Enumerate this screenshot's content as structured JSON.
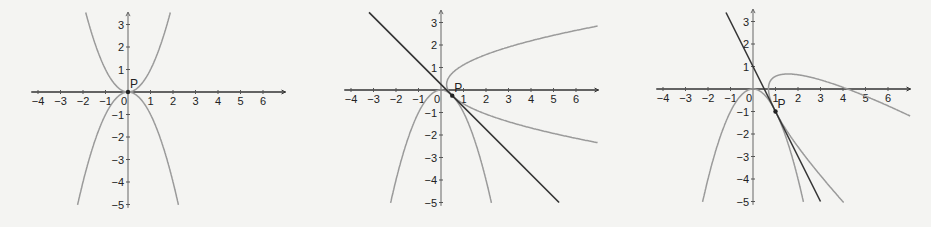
{
  "chart_data": [
    {
      "type": "line",
      "panel": "left",
      "title": "",
      "xlabel": "",
      "ylabel": "",
      "xlim": [
        -4,
        6
      ],
      "ylim": [
        -5,
        3
      ],
      "x_ticks": [
        "-4",
        "-3",
        "-2",
        "-1",
        "0",
        "1",
        "2",
        "3",
        "4",
        "5",
        "6"
      ],
      "y_ticks": [
        "3",
        "2",
        "1",
        "-1",
        "-2",
        "-3",
        "-4",
        "-5"
      ],
      "grid": false,
      "origin_px": [
        128,
        92
      ],
      "unit_px": 22.5,
      "point": {
        "label": "P",
        "x": 0,
        "y": 0
      },
      "series": [
        {
          "name": "y = x^2",
          "kind": "function",
          "expr": "x^2",
          "x_range": [
            -1.9,
            1.9
          ],
          "color": "#9a9a9a"
        },
        {
          "name": "y = -x^2",
          "kind": "function",
          "expr": "-x^2",
          "x_range": [
            -2.24,
            2.24
          ],
          "color": "#9a9a9a"
        }
      ],
      "tangent_line": {
        "slope": 0,
        "intercept": 0,
        "note": "x-axis is tangent at P"
      }
    },
    {
      "type": "line",
      "panel": "middle",
      "title": "",
      "xlabel": "",
      "ylabel": "",
      "xlim": [
        -4,
        6
      ],
      "ylim": [
        -5,
        3
      ],
      "x_ticks": [
        "-4",
        "-3",
        "-2",
        "-1",
        "0",
        "1",
        "2",
        "3",
        "4",
        "5",
        "6"
      ],
      "y_ticks": [
        "3",
        "2",
        "1",
        "-1",
        "-2",
        "-3",
        "-4",
        "-5"
      ],
      "grid": false,
      "origin_px": [
        441,
        90
      ],
      "unit_px": 22.5,
      "point": {
        "label": "P",
        "x": 0.5,
        "y": -0.25
      },
      "series": [
        {
          "name": "y = -x^2",
          "kind": "function",
          "expr": "-x^2",
          "x_range": [
            -2.24,
            2.24
          ],
          "color": "#9a9a9a"
        },
        {
          "name": "reflection of y = -x^2 across tangent",
          "kind": "reflection",
          "t_range": [
            -6,
            6
          ],
          "color": "#9a9a9a"
        },
        {
          "name": "tangent y = -x + 0.25",
          "kind": "line",
          "slope": -1,
          "intercept": 0.25,
          "x_range": [
            -3.2,
            5.25
          ],
          "color": "#333333"
        }
      ]
    },
    {
      "type": "line",
      "panel": "right",
      "title": "",
      "xlabel": "",
      "ylabel": "",
      "xlim": [
        -4,
        6
      ],
      "ylim": [
        -5,
        3
      ],
      "x_ticks": [
        "-4",
        "-3",
        "-2",
        "-1",
        "0",
        "1",
        "2",
        "3",
        "4",
        "5",
        "6"
      ],
      "y_ticks": [
        "3",
        "2",
        "1",
        "-1",
        "-2",
        "-3",
        "-4",
        "-5"
      ],
      "grid": false,
      "origin_px": [
        753,
        89
      ],
      "unit_px": 22.5,
      "point": {
        "label": "P",
        "x": 1,
        "y": -1
      },
      "series": [
        {
          "name": "y = -x^2",
          "kind": "function",
          "expr": "-x^2",
          "x_range": [
            -2.24,
            2.24
          ],
          "color": "#9a9a9a"
        },
        {
          "name": "reflection of y = -x^2 across tangent",
          "kind": "reflection",
          "t_range": [
            -6,
            6
          ],
          "color": "#9a9a9a"
        },
        {
          "name": "tangent y = -2x + 1",
          "kind": "line",
          "slope": -2,
          "intercept": 1,
          "x_range": [
            -1.2,
            3.0
          ],
          "color": "#333333"
        }
      ]
    }
  ]
}
